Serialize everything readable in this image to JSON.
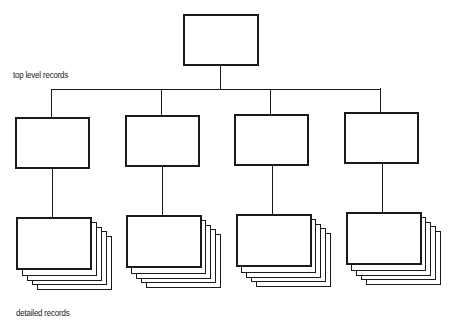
{
  "diagram": {
    "type": "hierarchy",
    "labels": {
      "top_level": "top level records",
      "detailed": "detailed records"
    },
    "root": {
      "id": "root"
    },
    "top_level_records": [
      {
        "id": "top-1"
      },
      {
        "id": "top-2"
      },
      {
        "id": "top-3"
      },
      {
        "id": "top-4"
      }
    ],
    "detailed_record_stacks": [
      {
        "parent": "top-1",
        "sheets": 5
      },
      {
        "parent": "top-2",
        "sheets": 5
      },
      {
        "parent": "top-3",
        "sheets": 5
      },
      {
        "parent": "top-4",
        "sheets": 5
      }
    ],
    "colors": {
      "stroke": "#1a1a1a",
      "fill": "#ffffff"
    }
  }
}
